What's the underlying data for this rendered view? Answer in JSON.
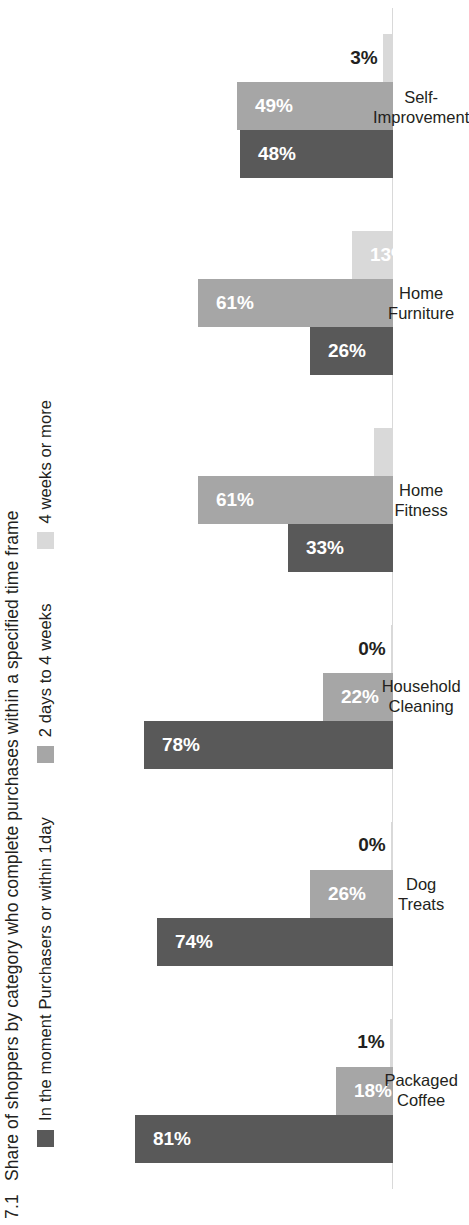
{
  "figure": {
    "number": "7.1",
    "title": "Share of shoppers by category who complete purchases within a specified time frame"
  },
  "legend": {
    "items": [
      {
        "label": "In the moment Purchasers or within 1day",
        "color": "#595959",
        "key": "in_the_moment"
      },
      {
        "label": "2 days to 4 weeks",
        "color": "#a6a6a6",
        "key": "two_days_to_four_weeks"
      },
      {
        "label": "4 weeks or more",
        "color": "#d9d9d9",
        "key": "four_weeks_or_more"
      }
    ]
  },
  "chart_data": {
    "type": "bar",
    "title": "Share of shoppers by category who complete purchases within a specified time frame",
    "xlabel": "",
    "ylabel": "",
    "ylim": [
      0,
      100
    ],
    "grid": false,
    "legend_position": "top",
    "orientation": "vertical-bars-rotated-page",
    "value_suffix": "%",
    "categories": [
      "Packaged\nCoffee",
      "Dog\nTreats",
      "Household\nCleaning",
      "Home\nFitness",
      "Home\nFurniture",
      "Self-\nImprovement"
    ],
    "series": [
      {
        "name": "In the moment Purchasers or within 1day",
        "color": "#595959",
        "values": [
          81,
          74,
          78,
          33,
          26,
          48
        ],
        "labels": [
          "81%",
          "74%",
          "78%",
          "33%",
          "26%",
          "48%"
        ]
      },
      {
        "name": "2 days to 4 weeks",
        "color": "#a6a6a6",
        "values": [
          18,
          26,
          22,
          61,
          61,
          49
        ],
        "labels": [
          "18%",
          "26%",
          "22%",
          "61%",
          "61%",
          "49%"
        ]
      },
      {
        "name": "4 weeks or more",
        "color": "#d9d9d9",
        "values": [
          1,
          0,
          0,
          6,
          13,
          3
        ],
        "labels": [
          "1%",
          "0%",
          "0%",
          "6%",
          "13%",
          "3%"
        ]
      }
    ]
  }
}
